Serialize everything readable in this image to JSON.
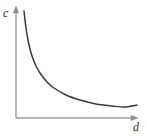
{
  "figure": {
    "width": 147,
    "height": 136,
    "background_color": "#ffffff",
    "axis_color": "#9a9a9a",
    "curve_color": "#3a3a3a",
    "label_color": "#2f2f2f"
  },
  "labels": {
    "y_axis": "c",
    "x_axis": "d"
  },
  "chart_data": {
    "type": "line",
    "title": "",
    "subtitle": "",
    "xlabel": "d",
    "ylabel": "c",
    "grid": false,
    "legend": false,
    "legend_position": "none",
    "axis_style": "arrow-tipped open axes, no tick marks, no tick labels",
    "xlim": [
      0,
      1
    ],
    "ylim": [
      0,
      1
    ],
    "series": [
      {
        "name": "cost-vs-distance",
        "color": "#3a3a3a",
        "x": [
          0.066,
          0.083,
          0.099,
          0.116,
          0.132,
          0.165,
          0.198,
          0.256,
          0.314,
          0.413,
          0.529,
          0.661,
          0.793,
          0.901,
          1.0
        ],
        "y": [
          0.964,
          0.811,
          0.703,
          0.622,
          0.559,
          0.468,
          0.405,
          0.324,
          0.27,
          0.207,
          0.162,
          0.126,
          0.108,
          0.1,
          0.117
        ],
        "pixel_points": [
          [
            24,
            11
          ],
          [
            26,
            28
          ],
          [
            28,
            40
          ],
          [
            30,
            49
          ],
          [
            32,
            56
          ],
          [
            36,
            66
          ],
          [
            40,
            73
          ],
          [
            47,
            82
          ],
          [
            54,
            88
          ],
          [
            66,
            95
          ],
          [
            80,
            100
          ],
          [
            96,
            104
          ],
          [
            112,
            106
          ],
          [
            125,
            107
          ],
          [
            137,
            105
          ]
        ]
      }
    ]
  },
  "axes": {
    "origin_px": [
      16,
      118
    ],
    "y_axis_top_px": [
      16,
      7
    ],
    "x_axis_right_px": [
      137,
      118
    ],
    "arrow_heads": [
      "y-axis-top",
      "x-axis-right"
    ]
  }
}
